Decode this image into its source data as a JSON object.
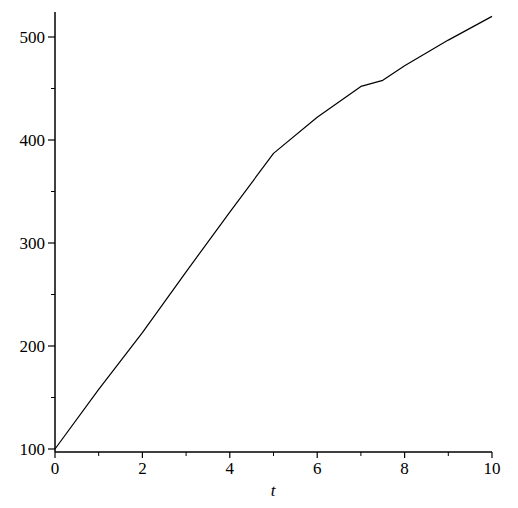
{
  "chart_data": {
    "type": "line",
    "title": "",
    "xlabel": "t",
    "ylabel": "",
    "xlim": [
      0,
      10
    ],
    "ylim": [
      100,
      520
    ],
    "grid": false,
    "legend": null,
    "x_ticks": [
      0,
      2,
      4,
      6,
      8,
      10
    ],
    "x_tick_labels": [
      "0",
      "2",
      "4",
      "6",
      "8",
      "10"
    ],
    "x_minor_ticks": [
      1,
      3,
      5,
      7,
      9
    ],
    "y_ticks": [
      100,
      200,
      300,
      400,
      500
    ],
    "y_tick_labels": [
      "100",
      "200",
      "300",
      "400",
      "500"
    ],
    "y_minor_ticks": [
      150,
      250,
      350,
      450
    ],
    "series": [
      {
        "name": "curve",
        "color": "#000000",
        "x": [
          0,
          1,
          2,
          3,
          4,
          5,
          6,
          7,
          7.5,
          8,
          9,
          10
        ],
        "y": [
          100,
          158,
          213,
          272,
          330,
          387,
          422,
          452,
          458,
          472,
          497,
          520
        ]
      }
    ],
    "annotations": [
      "kink at t=5 (~387)"
    ]
  },
  "axes": {
    "xlabel": "t"
  }
}
